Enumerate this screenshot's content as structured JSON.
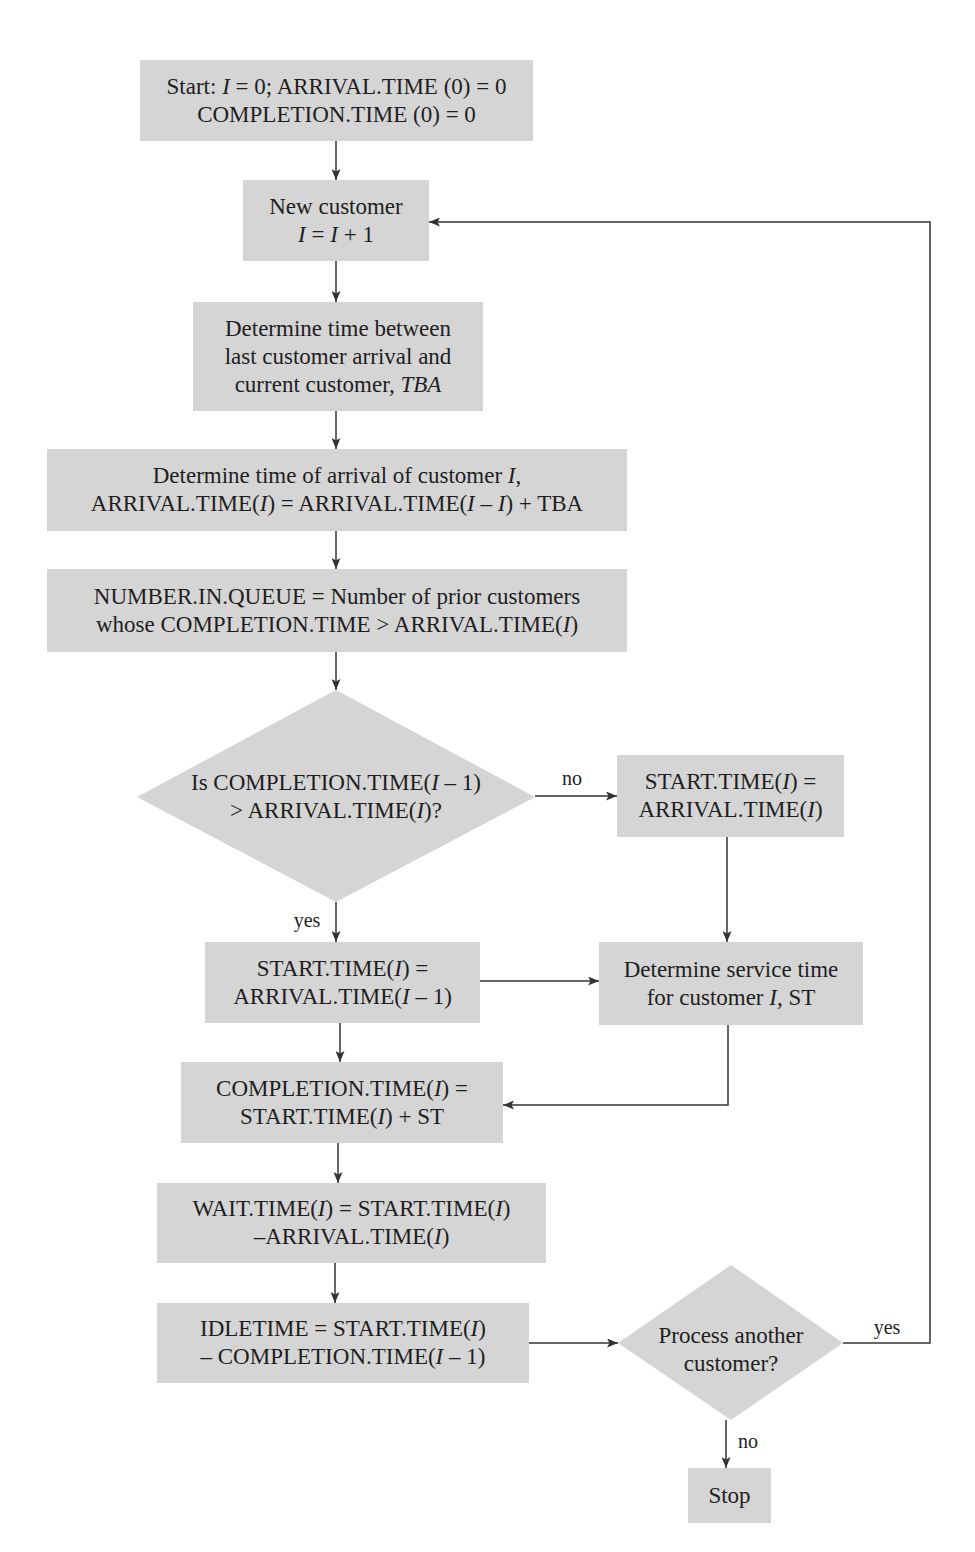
{
  "diagram": {
    "type": "flowchart",
    "fill_color": "#d5d5d5",
    "line_color": "#333333",
    "text_color": "#1e1e1e"
  },
  "nodes": {
    "start": {
      "shape": "rect",
      "lines": [
        [
          "Start: ",
          {
            "i": "I"
          },
          " = 0; ARRIVAL.TIME (0) = 0"
        ],
        [
          "COMPLETION.TIME (0) = 0"
        ]
      ]
    },
    "new_customer": {
      "shape": "rect",
      "lines": [
        [
          "New customer"
        ],
        [
          {
            "i": "I"
          },
          " = ",
          {
            "i": "I"
          },
          " + 1"
        ]
      ]
    },
    "time_between_arrivals": {
      "shape": "rect",
      "lines": [
        [
          "Determine time between"
        ],
        [
          "last customer arrival and"
        ],
        [
          "current customer, ",
          {
            "i": "TBA"
          }
        ]
      ]
    },
    "arrival_time": {
      "shape": "rect",
      "lines": [
        [
          "Determine time of arrival of customer ",
          {
            "i": "I"
          },
          ","
        ],
        [
          "ARRIVAL.TIME(",
          {
            "i": "I"
          },
          ") = ARRIVAL.TIME(",
          {
            "i": "I"
          },
          " – ",
          {
            "i": "I"
          },
          ") + TBA"
        ]
      ]
    },
    "number_in_queue": {
      "shape": "rect",
      "lines": [
        [
          "NUMBER.IN.QUEUE = Number of prior customers"
        ],
        [
          "whose COMPLETION.TIME > ARRIVAL.TIME(",
          {
            "i": "I"
          },
          ")"
        ]
      ]
    },
    "decision_completion": {
      "shape": "diamond",
      "lines": [
        [
          "Is COMPLETION.TIME(",
          {
            "i": "I"
          },
          " – 1)"
        ],
        [
          "> ARRIVAL.TIME(",
          {
            "i": "I"
          },
          ")?"
        ]
      ]
    },
    "start_time_no": {
      "shape": "rect",
      "lines": [
        [
          "START.TIME(",
          {
            "i": "I"
          },
          ") ="
        ],
        [
          "ARRIVAL.TIME(",
          {
            "i": "I"
          },
          ")"
        ]
      ]
    },
    "start_time_yes": {
      "shape": "rect",
      "lines": [
        [
          "START.TIME(",
          {
            "i": "I"
          },
          ") ="
        ],
        [
          "ARRIVAL.TIME(",
          {
            "i": "I"
          },
          " – 1)"
        ]
      ]
    },
    "service_time": {
      "shape": "rect",
      "lines": [
        [
          "Determine service time"
        ],
        [
          "for customer ",
          {
            "i": "I"
          },
          ", ST"
        ]
      ]
    },
    "completion_time": {
      "shape": "rect",
      "lines": [
        [
          "COMPLETION.TIME(",
          {
            "i": "I"
          },
          ") ="
        ],
        [
          "START.TIME(",
          {
            "i": "I"
          },
          ") + ST"
        ]
      ]
    },
    "wait_time": {
      "shape": "rect",
      "lines": [
        [
          "WAIT.TIME(",
          {
            "i": "I"
          },
          ") = START.TIME(",
          {
            "i": "I"
          },
          ")"
        ],
        [
          "–ARRIVAL.TIME(",
          {
            "i": "I"
          },
          ")"
        ]
      ]
    },
    "idle_time": {
      "shape": "rect",
      "lines": [
        [
          "IDLETIME = START.TIME(",
          {
            "i": "I"
          },
          ")"
        ],
        [
          "– COMPLETION.TIME(",
          {
            "i": "I"
          },
          " – 1)"
        ]
      ]
    },
    "decision_another": {
      "shape": "diamond",
      "lines": [
        [
          "Process another"
        ],
        [
          "customer?"
        ]
      ]
    },
    "stop": {
      "shape": "rect",
      "lines": [
        [
          "Stop"
        ]
      ]
    }
  },
  "edges": [
    {
      "from": "start",
      "to": "new_customer",
      "label": ""
    },
    {
      "from": "new_customer",
      "to": "time_between_arrivals",
      "label": ""
    },
    {
      "from": "time_between_arrivals",
      "to": "arrival_time",
      "label": ""
    },
    {
      "from": "arrival_time",
      "to": "number_in_queue",
      "label": ""
    },
    {
      "from": "number_in_queue",
      "to": "decision_completion",
      "label": ""
    },
    {
      "from": "decision_completion",
      "to": "start_time_no",
      "label": "no"
    },
    {
      "from": "decision_completion",
      "to": "start_time_yes",
      "label": "yes"
    },
    {
      "from": "start_time_no",
      "to": "service_time",
      "label": ""
    },
    {
      "from": "start_time_yes",
      "to": "service_time",
      "label": ""
    },
    {
      "from": "start_time_yes",
      "to": "completion_time",
      "label": ""
    },
    {
      "from": "service_time",
      "to": "completion_time",
      "label": ""
    },
    {
      "from": "completion_time",
      "to": "wait_time",
      "label": ""
    },
    {
      "from": "wait_time",
      "to": "idle_time",
      "label": ""
    },
    {
      "from": "idle_time",
      "to": "decision_another",
      "label": ""
    },
    {
      "from": "decision_another",
      "to": "new_customer",
      "label": "yes"
    },
    {
      "from": "decision_another",
      "to": "stop",
      "label": "no"
    }
  ],
  "edge_labels": {
    "completion_no": "no",
    "completion_yes": "yes",
    "another_yes": "yes",
    "another_no": "no"
  }
}
